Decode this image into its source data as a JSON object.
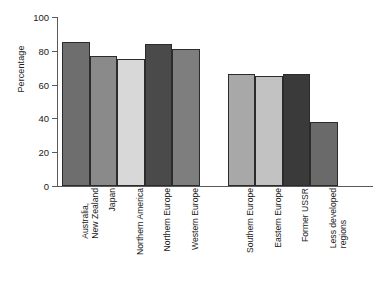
{
  "chart_data": {
    "type": "bar",
    "title": "",
    "xlabel": "",
    "ylabel": "Percentage",
    "ylim": [
      0,
      100
    ],
    "yticks": [
      0,
      20,
      40,
      60,
      80,
      100
    ],
    "grid": false,
    "legend": "none",
    "categories": [
      "Australia, New Zealand",
      "Japan",
      "Northern America",
      "Northern Europe",
      "Western Europe",
      "Southern Europe",
      "Eastern Europe",
      "Former USSR",
      "Less developed regions"
    ],
    "values": [
      85,
      77,
      75,
      84,
      81,
      66,
      65,
      66,
      38
    ],
    "bar_colors": [
      "#6e6e6e",
      "#8a8a8a",
      "#d8d8d8",
      "#4a4a4a",
      "#7e7e7e",
      "#a8a8a8",
      "#c2c2c2",
      "#3a3a3a",
      "#6a6a6a"
    ],
    "gap_after_index": 4
  },
  "axis": {
    "tick_labels": [
      "0",
      "20",
      "40",
      "60",
      "80",
      "100"
    ]
  },
  "labels": {
    "cat0_line1": "Australia,",
    "cat0_line2": "New Zealand",
    "cat1_line1": "Japan",
    "cat2_line1": "Northern America",
    "cat3_line1": "Northern Europe",
    "cat4_line1": "Western Europe",
    "cat5_line1": "Southern Europe",
    "cat6_line1": "Eastern Europe",
    "cat7_line1": "Former USSR",
    "cat8_line1": "Less developed",
    "cat8_line2": "regions"
  }
}
